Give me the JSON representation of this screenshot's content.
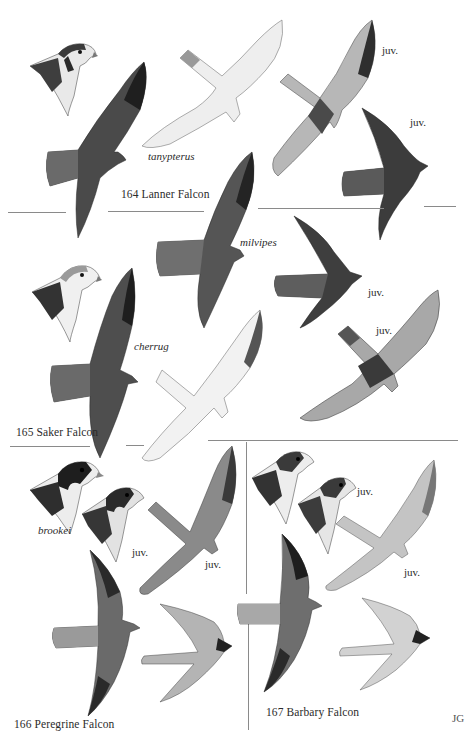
{
  "plate": {
    "colors": {
      "background": "#ffffff",
      "ink": "#2b2b2b",
      "rule": "#8a8a8a",
      "dark_plumage": "#3a3a3a",
      "mid_plumage": "#6e6e6e",
      "pale_plumage": "#d8d8d8"
    },
    "species": [
      {
        "number": "164",
        "name": "Lanner Falcon",
        "title": "164  Lanner Falcon",
        "labels": [
          "tanypterus",
          "juv.",
          "juv.",
          "milvipes"
        ]
      },
      {
        "number": "165",
        "name": "Saker Falcon",
        "title": "165  Saker Falcon",
        "labels": [
          "cherrug",
          "juv.",
          "juv."
        ]
      },
      {
        "number": "166",
        "name": "Peregrine Falcon",
        "title": "166  Peregrine Falcon",
        "labels": [
          "brookei",
          "juv.",
          "juv."
        ]
      },
      {
        "number": "167",
        "name": "Barbary Falcon",
        "title": "167  Barbary Falcon",
        "labels": [
          "juv.",
          "juv."
        ]
      }
    ],
    "signature": "JG"
  }
}
